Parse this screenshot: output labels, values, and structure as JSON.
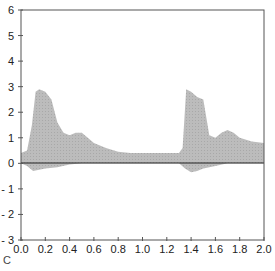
{
  "chart_data": {
    "type": "area",
    "title": "",
    "xlabel": "",
    "ylabel": "",
    "xlim": [
      0.0,
      2.0
    ],
    "ylim": [
      -3,
      6
    ],
    "grid": false,
    "legend": null,
    "x_ticks": [
      "0.0",
      "0.2",
      "0.4",
      "0.6",
      "0.8",
      "1.0",
      "1.2",
      "1.4",
      "1.6",
      "1.8",
      "2.0"
    ],
    "y_ticks": [
      "6",
      "5",
      "4",
      "3",
      "2",
      "1",
      "0",
      "- 1",
      "- 2",
      "- 3"
    ],
    "series": [
      {
        "name": "upper envelope",
        "x": [
          0.0,
          0.05,
          0.09,
          0.12,
          0.15,
          0.2,
          0.25,
          0.3,
          0.35,
          0.4,
          0.45,
          0.5,
          0.55,
          0.6,
          0.7,
          0.8,
          0.9,
          1.0,
          1.1,
          1.2,
          1.3,
          1.33,
          1.36,
          1.4,
          1.45,
          1.5,
          1.55,
          1.6,
          1.65,
          1.7,
          1.75,
          1.8,
          1.9,
          2.0
        ],
        "values": [
          0.4,
          0.5,
          1.5,
          2.8,
          2.9,
          2.8,
          2.5,
          1.6,
          1.2,
          1.1,
          1.2,
          1.2,
          1.0,
          0.8,
          0.6,
          0.45,
          0.4,
          0.4,
          0.4,
          0.4,
          0.4,
          0.6,
          2.9,
          2.8,
          2.6,
          2.5,
          1.1,
          1.0,
          1.2,
          1.3,
          1.2,
          1.0,
          0.85,
          0.8
        ]
      },
      {
        "name": "lower envelope",
        "x": [
          0.0,
          0.05,
          0.1,
          0.15,
          0.2,
          0.3,
          0.4,
          0.5,
          0.6,
          1.3,
          1.35,
          1.4,
          1.45,
          1.5,
          1.6,
          1.7,
          2.0
        ],
        "values": [
          0.0,
          -0.1,
          -0.3,
          -0.25,
          -0.2,
          -0.15,
          -0.05,
          0.0,
          0.0,
          0.0,
          -0.2,
          -0.35,
          -0.3,
          -0.2,
          -0.1,
          0.0,
          0.0
        ]
      }
    ]
  },
  "figure": {
    "corner_label": "C"
  }
}
